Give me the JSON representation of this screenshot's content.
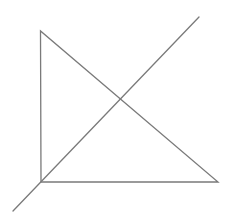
{
  "diagram": {
    "canvas": {
      "width": 235,
      "height": 216,
      "background": "#ffffff"
    },
    "stroke": {
      "color": "#7a7a7a",
      "width": 1.3
    },
    "triangle": {
      "points": [
        {
          "x": 40.5,
          "y": 31
        },
        {
          "x": 41,
          "y": 182
        },
        {
          "x": 218,
          "y": 182
        }
      ]
    },
    "diagonal": {
      "start": {
        "x": 13,
        "y": 211
      },
      "end": {
        "x": 199,
        "y": 17
      }
    },
    "intersection": {
      "x": 121.5,
      "y": 98.5
    }
  }
}
